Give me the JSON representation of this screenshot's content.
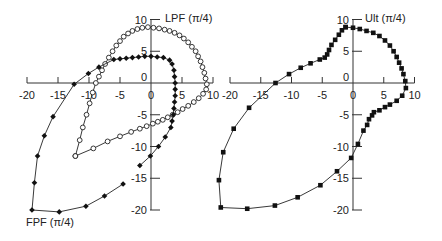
{
  "chart_data": [
    {
      "type": "line",
      "title": "",
      "xlabel": "",
      "ylabel": "",
      "xlim": [
        -20,
        10
      ],
      "ylim": [
        -20,
        10
      ],
      "x_ticks": [
        -20,
        -15,
        -10,
        -5,
        0,
        5,
        10
      ],
      "y_ticks": [
        10,
        5,
        0,
        -5,
        -10,
        -15,
        -20
      ],
      "grid": false,
      "axes_origin": [
        0,
        0
      ],
      "series": [
        {
          "name": "LPF (π/4)",
          "marker": "open-circle",
          "points": [
            [
              -12.2,
              -11.5
            ],
            [
              -11.5,
              -9
            ],
            [
              -11,
              -7
            ],
            [
              -10.4,
              -5
            ],
            [
              -9.9,
              -3.2
            ],
            [
              -9.4,
              -1.5
            ],
            [
              -8.9,
              0
            ],
            [
              -8.4,
              1
            ],
            [
              -7.9,
              2
            ],
            [
              -7.4,
              3
            ],
            [
              -6.8,
              4
            ],
            [
              -6.2,
              5
            ],
            [
              -5.6,
              5.9
            ],
            [
              -5,
              6.6
            ],
            [
              -4.4,
              7.3
            ],
            [
              -3.7,
              7.8
            ],
            [
              -3,
              8.2
            ],
            [
              -2.2,
              8.5
            ],
            [
              -1.4,
              8.7
            ],
            [
              -0.5,
              8.8
            ],
            [
              0.4,
              8.7
            ],
            [
              1.3,
              8.6
            ],
            [
              2.2,
              8.4
            ],
            [
              3,
              8.2
            ],
            [
              3.8,
              7.9
            ],
            [
              4.6,
              7.5
            ],
            [
              5.3,
              7
            ],
            [
              6,
              6.4
            ],
            [
              6.6,
              5.7
            ],
            [
              7.2,
              5
            ],
            [
              7.6,
              4.2
            ],
            [
              8,
              3.4
            ],
            [
              8.3,
              2.5
            ],
            [
              8.6,
              1.6
            ],
            [
              8.8,
              0.7
            ],
            [
              9,
              -0.2
            ],
            [
              8.9,
              -1
            ],
            [
              8.4,
              -1.7
            ],
            [
              7.7,
              -2.4
            ],
            [
              6.9,
              -3
            ],
            [
              6,
              -3.6
            ],
            [
              5.1,
              -4.1
            ],
            [
              4.3,
              -4.6
            ],
            [
              3.5,
              -5
            ],
            [
              2.7,
              -5.4
            ],
            [
              1.9,
              -5.8
            ],
            [
              1.1,
              -6.1
            ],
            [
              0.3,
              -6.4
            ],
            [
              -0.7,
              -6.8
            ],
            [
              -1.8,
              -7.2
            ],
            [
              -3.2,
              -7.7
            ],
            [
              -5,
              -8.4
            ],
            [
              -7,
              -9.2
            ],
            [
              -9.3,
              -10.3
            ],
            [
              -12.2,
              -11.5
            ]
          ]
        },
        {
          "name": "FPF (π/4)",
          "marker": "filled-diamond",
          "points": [
            [
              -1.8,
              -13
            ],
            [
              -0.1,
              -11.5
            ],
            [
              1.2,
              -10
            ],
            [
              2.3,
              -8.5
            ],
            [
              3.2,
              -7
            ],
            [
              3.4,
              -6
            ],
            [
              3.6,
              -5
            ],
            [
              3.7,
              -4
            ],
            [
              3.8,
              -3
            ],
            [
              3.9,
              -2
            ],
            [
              3.9,
              -1
            ],
            [
              3.9,
              0
            ],
            [
              3.8,
              1
            ],
            [
              3.7,
              2
            ],
            [
              3.4,
              3
            ],
            [
              3,
              3.6
            ],
            [
              2,
              4
            ],
            [
              1,
              4.1
            ],
            [
              0,
              4.2
            ],
            [
              -1,
              4.2
            ],
            [
              -2,
              4.1
            ],
            [
              -3,
              4
            ],
            [
              -4,
              3.9
            ],
            [
              -5,
              3.8
            ],
            [
              -6,
              3.7
            ],
            [
              -8.4,
              2.5
            ],
            [
              -10.1,
              1.5
            ],
            [
              -12.4,
              -0.2
            ],
            [
              -15.8,
              -5.3
            ],
            [
              -17.2,
              -8.3
            ],
            [
              -18.3,
              -11.5
            ],
            [
              -18.8,
              -15.7
            ],
            [
              -19.2,
              -20
            ],
            [
              -14.8,
              -20.3
            ],
            [
              -10.5,
              -19.4
            ],
            [
              -7.5,
              -17.8
            ],
            [
              -4.5,
              -15.9
            ]
          ]
        }
      ],
      "annotations": [
        "LPF (π/4)",
        "FPF (π/4)"
      ]
    },
    {
      "type": "line",
      "title": "",
      "xlabel": "",
      "ylabel": "",
      "xlim": [
        -20,
        10
      ],
      "ylim": [
        -20,
        10
      ],
      "x_ticks": [
        -20,
        -15,
        -10,
        -5,
        0,
        5,
        10
      ],
      "y_ticks": [
        10,
        5,
        0,
        -5,
        -10,
        -15,
        -20
      ],
      "grid": false,
      "axes_origin": [
        0,
        0
      ],
      "series": [
        {
          "name": "Ult (π/4)",
          "marker": "filled-square",
          "points": [
            [
              -1.2,
              8.8
            ],
            [
              0,
              8.7
            ],
            [
              1.1,
              8.5
            ],
            [
              2.2,
              8.2
            ],
            [
              3.3,
              7.9
            ],
            [
              4.3,
              7.4
            ],
            [
              5.2,
              6.7
            ],
            [
              6,
              5.9
            ],
            [
              6.6,
              5
            ],
            [
              7.1,
              4.1
            ],
            [
              7.5,
              3.2
            ],
            [
              7.9,
              2.3
            ],
            [
              8.2,
              1.4
            ],
            [
              8.5,
              0.3
            ],
            [
              8.6,
              -0.8
            ],
            [
              8,
              -2
            ],
            [
              7.1,
              -2.8
            ],
            [
              6,
              -3.4
            ],
            [
              5.2,
              -3.8
            ],
            [
              4.3,
              -4.3
            ],
            [
              3.4,
              -4.6
            ],
            [
              3.1,
              -5.1
            ],
            [
              2.6,
              -5.7
            ],
            [
              2.3,
              -6.6
            ],
            [
              1.7,
              -7.5
            ],
            [
              0.8,
              -9.6
            ],
            [
              -0.3,
              -11.8
            ],
            [
              -2.6,
              -13.9
            ],
            [
              -5.3,
              -16.1
            ],
            [
              -9,
              -18
            ],
            [
              -12.7,
              -19.3
            ],
            [
              -17.2,
              -19.8
            ],
            [
              -21.5,
              -19.6
            ],
            [
              -21.8,
              -15.3
            ],
            [
              -21.1,
              -10.9
            ],
            [
              -19.4,
              -7.2
            ],
            [
              -16.9,
              -3.9
            ],
            [
              -12.6,
              0
            ],
            [
              -10.4,
              1.4
            ],
            [
              -8.5,
              2.4
            ],
            [
              -6.9,
              3.1
            ],
            [
              -5.4,
              3.7
            ],
            [
              -4.6,
              4
            ],
            [
              -4.2,
              4.5
            ],
            [
              -3.9,
              5.2
            ],
            [
              -3.5,
              6
            ],
            [
              -2.9,
              6.8
            ],
            [
              -2.3,
              7.6
            ],
            [
              -1.8,
              8.3
            ],
            [
              -1.2,
              8.8
            ]
          ]
        }
      ],
      "annotations": [
        "Ult (π/4)"
      ]
    }
  ],
  "labels": {
    "lpf": "LPF (π/4)",
    "fpf": "FPF (π/4)",
    "ult": "Ult (π/4)"
  },
  "colors": {
    "axis": "#333333",
    "line": "#222222",
    "marker_fill": "#111111",
    "open_marker_fill": "#ffffff"
  }
}
